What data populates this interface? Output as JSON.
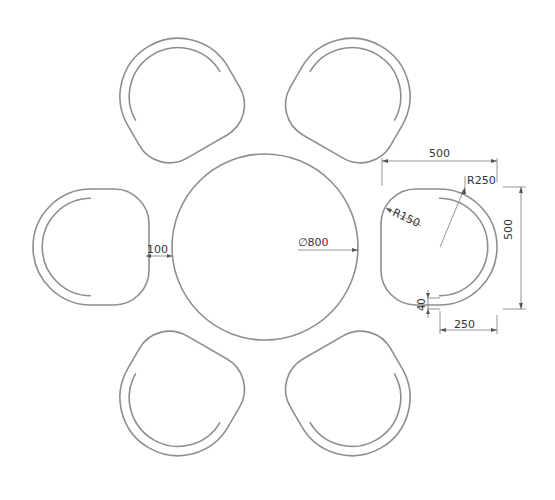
{
  "drawing": {
    "title": "Round table with six chairs - plan view",
    "scale_px_per_unit": 0.232,
    "table": {
      "center": [
        265,
        247
      ],
      "diameter_units": 800
    },
    "chairs": {
      "count": 6,
      "angles_deg": [
        0,
        60,
        120,
        180,
        240,
        300
      ],
      "distance_units": 750,
      "width_units": 500,
      "depth_units": 500,
      "back_radius_units": 250,
      "corner_radius_units": 150,
      "backrest_thickness_units": 40
    },
    "colors": {
      "outline": "#8e8e8e",
      "dimension": "#7a7a7a",
      "text": "#333333"
    }
  },
  "dimensions": {
    "table_diameter": "∅800",
    "gap": "100",
    "chair_width_top": "500",
    "chair_height_side": "500",
    "back_radius": "R250",
    "corner_radius": "R150",
    "backrest_thickness": "40",
    "half_width_bottom": "250"
  }
}
